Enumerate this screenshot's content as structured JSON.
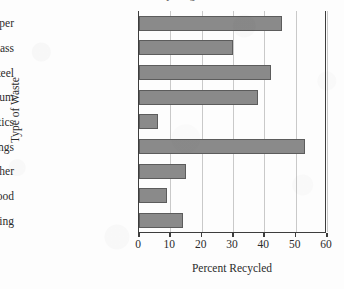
{
  "figure": {
    "title_cropped": "Recycling",
    "background_color": "#fdfdfd",
    "bar_color": "#8a8a8a",
    "bar_edge_color": "#5c5c5c",
    "axis_color": "#3d3d3d",
    "gridline_color": "#c9c9c9"
  },
  "chart_data": {
    "type": "bar",
    "orientation": "horizontal",
    "title": "",
    "xlabel": "Percent Recycled",
    "ylabel": "Type of Waste",
    "categories": [
      "Paper",
      "Glass",
      "Steel",
      "Aluminum",
      "Plastics",
      "Yard trimmings",
      "Rubber and Leather",
      "Wood",
      "Clothing"
    ],
    "values": [
      45.7,
      30,
      42,
      38,
      6,
      53,
      15,
      9,
      14
    ],
    "xlim": [
      0,
      60
    ],
    "xticks": [
      0,
      10,
      20,
      30,
      40,
      50,
      60
    ],
    "xtick_labels": [
      "0",
      "10",
      "20",
      "30",
      "40",
      "50",
      "60"
    ],
    "grid": "vertical",
    "legend": "none"
  }
}
